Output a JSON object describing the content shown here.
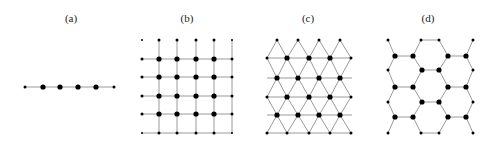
{
  "figure": {
    "panels": [
      {
        "id": "a",
        "label": "(a)",
        "lattice": "1D chain",
        "label_x": 71
      },
      {
        "id": "b",
        "label": "(b)",
        "lattice": "square",
        "label_x": 187
      },
      {
        "id": "c",
        "label": "(c)",
        "lattice": "triangular",
        "label_x": 308
      },
      {
        "id": "d",
        "label": "(d)",
        "lattice": "honeycomb",
        "label_x": 428
      }
    ],
    "colors": {
      "site": "#000000",
      "bond": "#9a9a9a",
      "background": "#ffffff"
    }
  }
}
